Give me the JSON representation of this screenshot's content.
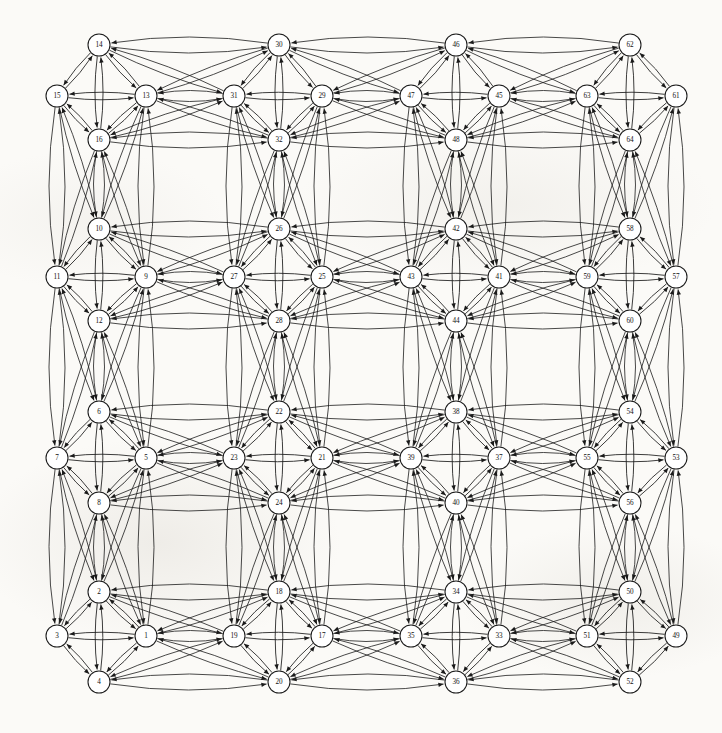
{
  "figure": {
    "type": "directed-graph",
    "title": "",
    "background_color": "#fbfaf7",
    "node_fill": "#ffffff",
    "node_stroke": "#1a1a1a",
    "edge_color": "#1a1a1a",
    "node_radius": 11,
    "width": 722,
    "height": 733,
    "node_count": 64,
    "cluster_count": 16,
    "cluster_size": 4,
    "layout": "4x4 grid of 4-node diamond clusters, all edges bidirectional curved arcs"
  },
  "nodes": [
    {
      "id": 14,
      "label": "14",
      "x": 99,
      "y": 45,
      "cluster": "c-0-0",
      "role": "top"
    },
    {
      "id": 15,
      "label": "15",
      "x": 57,
      "y": 96,
      "cluster": "c-0-0",
      "role": "left"
    },
    {
      "id": 13,
      "label": "13",
      "x": 146,
      "y": 96,
      "cluster": "c-0-0",
      "role": "right"
    },
    {
      "id": 16,
      "label": "16",
      "x": 99,
      "y": 140,
      "cluster": "c-0-0",
      "role": "bottom"
    },
    {
      "id": 30,
      "label": "30",
      "x": 279,
      "y": 45,
      "cluster": "c-0-1",
      "role": "top"
    },
    {
      "id": 31,
      "label": "31",
      "x": 234,
      "y": 96,
      "cluster": "c-0-1",
      "role": "left"
    },
    {
      "id": 29,
      "label": "29",
      "x": 322,
      "y": 96,
      "cluster": "c-0-1",
      "role": "right"
    },
    {
      "id": 32,
      "label": "32",
      "x": 279,
      "y": 140,
      "cluster": "c-0-1",
      "role": "bottom"
    },
    {
      "id": 46,
      "label": "46",
      "x": 456,
      "y": 45,
      "cluster": "c-0-2",
      "role": "top"
    },
    {
      "id": 47,
      "label": "47",
      "x": 411,
      "y": 96,
      "cluster": "c-0-2",
      "role": "left"
    },
    {
      "id": 45,
      "label": "45",
      "x": 499,
      "y": 96,
      "cluster": "c-0-2",
      "role": "right"
    },
    {
      "id": 48,
      "label": "48",
      "x": 456,
      "y": 140,
      "cluster": "c-0-2",
      "role": "bottom"
    },
    {
      "id": 62,
      "label": "62",
      "x": 630,
      "y": 45,
      "cluster": "c-0-3",
      "role": "top"
    },
    {
      "id": 63,
      "label": "63",
      "x": 587,
      "y": 96,
      "cluster": "c-0-3",
      "role": "left"
    },
    {
      "id": 61,
      "label": "61",
      "x": 676,
      "y": 96,
      "cluster": "c-0-3",
      "role": "right"
    },
    {
      "id": 64,
      "label": "64",
      "x": 630,
      "y": 140,
      "cluster": "c-0-3",
      "role": "bottom"
    },
    {
      "id": 10,
      "label": "10",
      "x": 99,
      "y": 229,
      "cluster": "c-1-0",
      "role": "top"
    },
    {
      "id": 11,
      "label": "11",
      "x": 57,
      "y": 277,
      "cluster": "c-1-0",
      "role": "left"
    },
    {
      "id": 9,
      "label": "9",
      "x": 146,
      "y": 277,
      "cluster": "c-1-0",
      "role": "right"
    },
    {
      "id": 12,
      "label": "12",
      "x": 99,
      "y": 321,
      "cluster": "c-1-0",
      "role": "bottom"
    },
    {
      "id": 26,
      "label": "26",
      "x": 279,
      "y": 229,
      "cluster": "c-1-1",
      "role": "top"
    },
    {
      "id": 27,
      "label": "27",
      "x": 234,
      "y": 277,
      "cluster": "c-1-1",
      "role": "left"
    },
    {
      "id": 25,
      "label": "25",
      "x": 322,
      "y": 277,
      "cluster": "c-1-1",
      "role": "right"
    },
    {
      "id": 28,
      "label": "28",
      "x": 279,
      "y": 321,
      "cluster": "c-1-1",
      "role": "bottom"
    },
    {
      "id": 42,
      "label": "42",
      "x": 456,
      "y": 229,
      "cluster": "c-1-2",
      "role": "top"
    },
    {
      "id": 43,
      "label": "43",
      "x": 411,
      "y": 277,
      "cluster": "c-1-2",
      "role": "left"
    },
    {
      "id": 41,
      "label": "41",
      "x": 499,
      "y": 277,
      "cluster": "c-1-2",
      "role": "right"
    },
    {
      "id": 44,
      "label": "44",
      "x": 456,
      "y": 321,
      "cluster": "c-1-2",
      "role": "bottom"
    },
    {
      "id": 58,
      "label": "58",
      "x": 630,
      "y": 229,
      "cluster": "c-1-3",
      "role": "top"
    },
    {
      "id": 59,
      "label": "59",
      "x": 587,
      "y": 277,
      "cluster": "c-1-3",
      "role": "left"
    },
    {
      "id": 57,
      "label": "57",
      "x": 676,
      "y": 277,
      "cluster": "c-1-3",
      "role": "right"
    },
    {
      "id": 60,
      "label": "60",
      "x": 630,
      "y": 321,
      "cluster": "c-1-3",
      "role": "bottom"
    },
    {
      "id": 6,
      "label": "6",
      "x": 99,
      "y": 412,
      "cluster": "c-2-0",
      "role": "top"
    },
    {
      "id": 7,
      "label": "7",
      "x": 57,
      "y": 458,
      "cluster": "c-2-0",
      "role": "left"
    },
    {
      "id": 5,
      "label": "5",
      "x": 146,
      "y": 458,
      "cluster": "c-2-0",
      "role": "right"
    },
    {
      "id": 8,
      "label": "8",
      "x": 99,
      "y": 503,
      "cluster": "c-2-0",
      "role": "bottom"
    },
    {
      "id": 22,
      "label": "22",
      "x": 279,
      "y": 412,
      "cluster": "c-2-1",
      "role": "top"
    },
    {
      "id": 23,
      "label": "23",
      "x": 234,
      "y": 458,
      "cluster": "c-2-1",
      "role": "left"
    },
    {
      "id": 21,
      "label": "21",
      "x": 322,
      "y": 458,
      "cluster": "c-2-1",
      "role": "right"
    },
    {
      "id": 24,
      "label": "24",
      "x": 279,
      "y": 503,
      "cluster": "c-2-1",
      "role": "bottom"
    },
    {
      "id": 38,
      "label": "38",
      "x": 456,
      "y": 412,
      "cluster": "c-2-2",
      "role": "top"
    },
    {
      "id": 39,
      "label": "39",
      "x": 411,
      "y": 458,
      "cluster": "c-2-2",
      "role": "left"
    },
    {
      "id": 37,
      "label": "37",
      "x": 499,
      "y": 458,
      "cluster": "c-2-2",
      "role": "right"
    },
    {
      "id": 40,
      "label": "40",
      "x": 456,
      "y": 503,
      "cluster": "c-2-2",
      "role": "bottom"
    },
    {
      "id": 54,
      "label": "54",
      "x": 630,
      "y": 412,
      "cluster": "c-2-3",
      "role": "top"
    },
    {
      "id": 55,
      "label": "55",
      "x": 587,
      "y": 458,
      "cluster": "c-2-3",
      "role": "left"
    },
    {
      "id": 53,
      "label": "53",
      "x": 676,
      "y": 458,
      "cluster": "c-2-3",
      "role": "right"
    },
    {
      "id": 56,
      "label": "56",
      "x": 630,
      "y": 503,
      "cluster": "c-2-3",
      "role": "bottom"
    },
    {
      "id": 2,
      "label": "2",
      "x": 99,
      "y": 592,
      "cluster": "c-3-0",
      "role": "top"
    },
    {
      "id": 3,
      "label": "3",
      "x": 57,
      "y": 636,
      "cluster": "c-3-0",
      "role": "left"
    },
    {
      "id": 1,
      "label": "1",
      "x": 146,
      "y": 636,
      "cluster": "c-3-0",
      "role": "right"
    },
    {
      "id": 4,
      "label": "4",
      "x": 99,
      "y": 682,
      "cluster": "c-3-0",
      "role": "bottom"
    },
    {
      "id": 18,
      "label": "18",
      "x": 279,
      "y": 592,
      "cluster": "c-3-1",
      "role": "top"
    },
    {
      "id": 19,
      "label": "19",
      "x": 234,
      "y": 636,
      "cluster": "c-3-1",
      "role": "left"
    },
    {
      "id": 17,
      "label": "17",
      "x": 322,
      "y": 636,
      "cluster": "c-3-1",
      "role": "right"
    },
    {
      "id": 20,
      "label": "20",
      "x": 279,
      "y": 682,
      "cluster": "c-3-1",
      "role": "bottom"
    },
    {
      "id": 34,
      "label": "34",
      "x": 456,
      "y": 592,
      "cluster": "c-3-2",
      "role": "top"
    },
    {
      "id": 35,
      "label": "35",
      "x": 411,
      "y": 636,
      "cluster": "c-3-2",
      "role": "left"
    },
    {
      "id": 33,
      "label": "33",
      "x": 499,
      "y": 636,
      "cluster": "c-3-2",
      "role": "right"
    },
    {
      "id": 36,
      "label": "36",
      "x": 456,
      "y": 682,
      "cluster": "c-3-2",
      "role": "bottom"
    },
    {
      "id": 50,
      "label": "50",
      "x": 630,
      "y": 592,
      "cluster": "c-3-3",
      "role": "top"
    },
    {
      "id": 51,
      "label": "51",
      "x": 587,
      "y": 636,
      "cluster": "c-3-3",
      "role": "left"
    },
    {
      "id": 49,
      "label": "49",
      "x": 676,
      "y": 636,
      "cluster": "c-3-3",
      "role": "right"
    },
    {
      "id": 52,
      "label": "52",
      "x": 630,
      "y": 682,
      "cluster": "c-3-3",
      "role": "bottom"
    }
  ],
  "clusters": [
    {
      "id": "c-0-0",
      "row": 0,
      "col": 0,
      "members": [
        14,
        15,
        13,
        16
      ]
    },
    {
      "id": "c-0-1",
      "row": 0,
      "col": 1,
      "members": [
        30,
        31,
        29,
        32
      ]
    },
    {
      "id": "c-0-2",
      "row": 0,
      "col": 2,
      "members": [
        46,
        47,
        45,
        48
      ]
    },
    {
      "id": "c-0-3",
      "row": 0,
      "col": 3,
      "members": [
        62,
        63,
        61,
        64
      ]
    },
    {
      "id": "c-1-0",
      "row": 1,
      "col": 0,
      "members": [
        10,
        11,
        9,
        12
      ]
    },
    {
      "id": "c-1-1",
      "row": 1,
      "col": 1,
      "members": [
        26,
        27,
        25,
        28
      ]
    },
    {
      "id": "c-1-2",
      "row": 1,
      "col": 2,
      "members": [
        42,
        43,
        41,
        44
      ]
    },
    {
      "id": "c-1-3",
      "row": 1,
      "col": 3,
      "members": [
        58,
        59,
        57,
        60
      ]
    },
    {
      "id": "c-2-0",
      "row": 2,
      "col": 0,
      "members": [
        6,
        7,
        5,
        8
      ]
    },
    {
      "id": "c-2-1",
      "row": 2,
      "col": 1,
      "members": [
        22,
        23,
        21,
        24
      ]
    },
    {
      "id": "c-2-2",
      "row": 2,
      "col": 2,
      "members": [
        38,
        39,
        37,
        40
      ]
    },
    {
      "id": "c-2-3",
      "row": 2,
      "col": 3,
      "members": [
        54,
        55,
        53,
        56
      ]
    },
    {
      "id": "c-3-0",
      "row": 3,
      "col": 0,
      "members": [
        2,
        3,
        1,
        4
      ]
    },
    {
      "id": "c-3-1",
      "row": 3,
      "col": 1,
      "members": [
        18,
        19,
        17,
        20
      ]
    },
    {
      "id": "c-3-2",
      "row": 3,
      "col": 2,
      "members": [
        34,
        35,
        33,
        36
      ]
    },
    {
      "id": "c-3-3",
      "row": 3,
      "col": 3,
      "members": [
        50,
        51,
        49,
        52
      ]
    }
  ],
  "intra_cluster_pairs": [
    [
      "top",
      "left"
    ],
    [
      "top",
      "right"
    ],
    [
      "top",
      "bottom"
    ],
    [
      "left",
      "right"
    ],
    [
      "left",
      "bottom"
    ],
    [
      "right",
      "bottom"
    ]
  ],
  "inter_cluster_links": [
    {
      "from": "c-0-0",
      "to": "c-0-1",
      "dir": "horizontal"
    },
    {
      "from": "c-0-1",
      "to": "c-0-2",
      "dir": "horizontal"
    },
    {
      "from": "c-0-2",
      "to": "c-0-3",
      "dir": "horizontal"
    },
    {
      "from": "c-1-0",
      "to": "c-1-1",
      "dir": "horizontal"
    },
    {
      "from": "c-1-1",
      "to": "c-1-2",
      "dir": "horizontal"
    },
    {
      "from": "c-1-2",
      "to": "c-1-3",
      "dir": "horizontal"
    },
    {
      "from": "c-2-0",
      "to": "c-2-1",
      "dir": "horizontal"
    },
    {
      "from": "c-2-1",
      "to": "c-2-2",
      "dir": "horizontal"
    },
    {
      "from": "c-2-2",
      "to": "c-2-3",
      "dir": "horizontal"
    },
    {
      "from": "c-3-0",
      "to": "c-3-1",
      "dir": "horizontal"
    },
    {
      "from": "c-3-1",
      "to": "c-3-2",
      "dir": "horizontal"
    },
    {
      "from": "c-3-2",
      "to": "c-3-3",
      "dir": "horizontal"
    },
    {
      "from": "c-0-0",
      "to": "c-1-0",
      "dir": "vertical"
    },
    {
      "from": "c-1-0",
      "to": "c-2-0",
      "dir": "vertical"
    },
    {
      "from": "c-2-0",
      "to": "c-3-0",
      "dir": "vertical"
    },
    {
      "from": "c-0-1",
      "to": "c-1-1",
      "dir": "vertical"
    },
    {
      "from": "c-1-1",
      "to": "c-2-1",
      "dir": "vertical"
    },
    {
      "from": "c-2-1",
      "to": "c-3-1",
      "dir": "vertical"
    },
    {
      "from": "c-0-2",
      "to": "c-1-2",
      "dir": "vertical"
    },
    {
      "from": "c-1-2",
      "to": "c-2-2",
      "dir": "vertical"
    },
    {
      "from": "c-2-2",
      "to": "c-3-2",
      "dir": "vertical"
    },
    {
      "from": "c-0-3",
      "to": "c-1-3",
      "dir": "vertical"
    },
    {
      "from": "c-1-3",
      "to": "c-2-3",
      "dir": "vertical"
    },
    {
      "from": "c-2-3",
      "to": "c-3-3",
      "dir": "vertical"
    }
  ]
}
